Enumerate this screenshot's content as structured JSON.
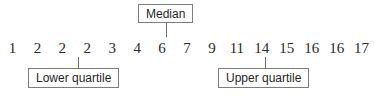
{
  "figure": {
    "type": "annotated-number-line",
    "values": [
      "1",
      "2",
      "2",
      "2",
      "3",
      "4",
      "6",
      "7",
      "9",
      "11",
      "14",
      "15",
      "16",
      "16",
      "17"
    ],
    "annotations": {
      "median": {
        "label": "Median",
        "value": "7",
        "position_index": 7
      },
      "lower_quartile": {
        "label": "Lower quartile",
        "value": "2",
        "position_index": 3
      },
      "upper_quartile": {
        "label": "Upper quartile",
        "value": "15",
        "position_index": 11
      }
    },
    "colors": {
      "text": "#2b2b2b",
      "box_border": "#7d7d7d",
      "leader_line": "#6f6f6f",
      "background": "#ffffff"
    }
  },
  "chart_data": {
    "type": "table",
    "title": "",
    "categories": [
      "1",
      "2",
      "3",
      "4",
      "5",
      "6",
      "7",
      "8",
      "9",
      "10",
      "11",
      "12",
      "13",
      "14",
      "15"
    ],
    "values": [
      1,
      2,
      2,
      2,
      3,
      4,
      6,
      7,
      9,
      11,
      14,
      15,
      16,
      16,
      17
    ],
    "xlabel": "",
    "ylabel": "",
    "annotations": [
      {
        "label": "Lower quartile",
        "at_index": 3,
        "at_value": 2
      },
      {
        "label": "Median",
        "at_index": 7,
        "at_value": 7
      },
      {
        "label": "Upper quartile",
        "at_index": 11,
        "at_value": 15
      }
    ]
  }
}
